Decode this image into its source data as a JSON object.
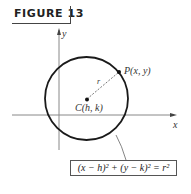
{
  "figure": {
    "label": "FIGURE 13"
  },
  "axes": {
    "x_label": "x",
    "y_label": "y"
  },
  "points": {
    "center_label": "C(h, k)",
    "point_label": "P(x, y)",
    "radius_label": "r"
  },
  "equation": {
    "text": "(x − h)² + (y − k)² = r²"
  },
  "colors": {
    "stroke": "#1a1a1a",
    "axis": "#888888",
    "text": "#333333"
  }
}
